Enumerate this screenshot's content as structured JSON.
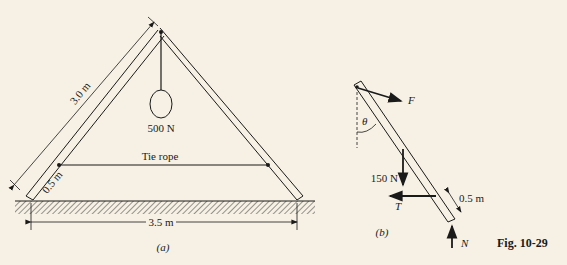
{
  "figure": {
    "caption": "Fig. 10-29",
    "panel_a": {
      "label": "(a)",
      "ladder_length": "3.0 m",
      "rope_offset": "0.5 m",
      "weight": "500 N",
      "tie_rope": "Tie rope",
      "base_span": "3.5 m"
    },
    "panel_b": {
      "label": "(b)",
      "force_F": "F",
      "angle": "θ",
      "weight": "150 N",
      "tension": "T",
      "offset": "0.5 m",
      "normal": "N"
    }
  }
}
